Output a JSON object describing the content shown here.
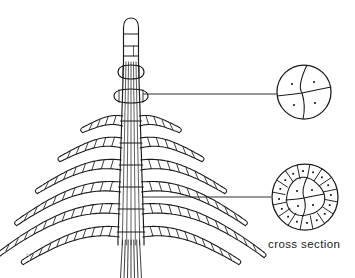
{
  "figure": {
    "title": "",
    "kind": "botanical-line-drawing",
    "background_color": "#ffffff",
    "ink_color": "#1b1b1b",
    "labels": {
      "cross_section": "cross section"
    },
    "organism": {
      "axis": {
        "name": "central-axis",
        "cell_strands": 7,
        "node_count": 8,
        "top_y": 18,
        "bottom_y": 278
      },
      "apex": {
        "name": "apical-cell",
        "shape": "bullet",
        "segment_divisions": 3,
        "center_x": 131,
        "top_y": 18,
        "bottom_y": 62
      },
      "whorls": [
        {
          "index": 1,
          "y": 72,
          "half_span": 13,
          "branch_cells": 2,
          "droop": 2,
          "type": "node-swelling"
        },
        {
          "index": 2,
          "y": 96,
          "half_span": 17,
          "branch_cells": 3,
          "droop": 3,
          "type": "node-swelling"
        },
        {
          "index": 3,
          "y": 121,
          "half_span": 40,
          "branch_cells": 5,
          "droop": 9,
          "type": "branchlet-whorl"
        },
        {
          "index": 4,
          "y": 143,
          "half_span": 62,
          "branch_cells": 7,
          "droop": 16,
          "type": "branchlet-whorl"
        },
        {
          "index": 5,
          "y": 165,
          "half_span": 84,
          "branch_cells": 9,
          "droop": 26,
          "type": "branchlet-whorl"
        },
        {
          "index": 6,
          "y": 187,
          "half_span": 104,
          "branch_cells": 11,
          "droop": 36,
          "type": "branchlet-whorl"
        },
        {
          "index": 7,
          "y": 209,
          "half_span": 122,
          "branch_cells": 13,
          "droop": 46,
          "type": "branchlet-whorl"
        },
        {
          "index": 8,
          "y": 232,
          "half_span": 96,
          "branch_cells": 11,
          "droop": 30,
          "type": "branchlet-whorl"
        }
      ],
      "rhizoid": {
        "name": "basal-filaments",
        "strand_count": 7,
        "top_y": 240,
        "bottom_y": 278
      }
    },
    "leaders": [
      {
        "name": "leader-upper",
        "from_x": 143,
        "from_y": 94,
        "to_x": 277,
        "to_y": 94
      },
      {
        "name": "leader-lower",
        "from_x": 142,
        "from_y": 197,
        "to_x": 271,
        "to_y": 197
      }
    ],
    "cross_sections": [
      {
        "name": "cross-section-upper",
        "description": "axis cross section showing four large central cells each with a nucleus",
        "cx": 304,
        "cy": 92,
        "r": 27,
        "central_cells": 4,
        "cortical_cells": 0,
        "nuclei": 4
      },
      {
        "name": "cross-section-lower",
        "description": "axis cross section showing four central cells surrounded by a ring of cortical cells, each cell with a nucleus",
        "cx": 305,
        "cy": 197,
        "r": 33,
        "inner_r": 19,
        "central_cells": 4,
        "cortical_cells": 16,
        "nuclei": 20
      }
    ]
  }
}
